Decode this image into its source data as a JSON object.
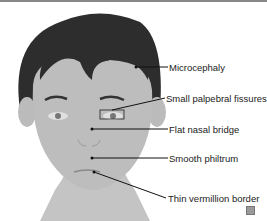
{
  "figure": {
    "type": "medical-illustration",
    "colors": {
      "hair": "#2b2b2b",
      "skin": "#bdbdbd",
      "line": "#1a1a1a"
    },
    "labels": [
      {
        "id": "microcephaly",
        "text": "Microcephaly"
      },
      {
        "id": "palpebral",
        "text": "Small palpebral fissures"
      },
      {
        "id": "nasal",
        "text": "Flat nasal bridge"
      },
      {
        "id": "philtrum",
        "text": "Smooth philtrum"
      },
      {
        "id": "vermillion",
        "text": "Thin vermillion border"
      }
    ]
  }
}
